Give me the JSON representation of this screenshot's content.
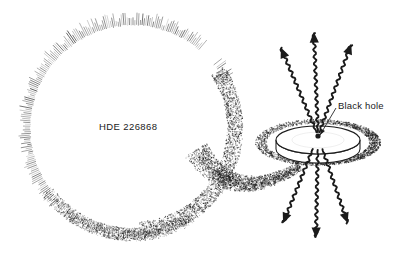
{
  "diagram": {
    "background_color": "#ffffff",
    "ink_color": "#1b1b1b",
    "labels": {
      "star": "HDE 226868",
      "black_hole": "Black hole"
    },
    "objects": {
      "star": {
        "name": "supergiant-star",
        "center_x": 133,
        "center_y": 128,
        "radius": 104,
        "render": "radial-hatch-spikes",
        "spike_count": 360
      },
      "accretion_disk": {
        "name": "accretion-disk",
        "center_x": 318,
        "center_y": 140,
        "rx": 42,
        "ry": 14,
        "thickness": 9,
        "outer_ring_rx": 57,
        "outer_ring_ry": 21,
        "render": "solid-ellipse-with-stippled-outer-ring"
      },
      "black_hole": {
        "name": "black-hole-point",
        "x": 318,
        "y": 136,
        "radius": 2.6
      },
      "accretion_stream": {
        "name": "accretion-stream",
        "render": "stipple",
        "from": "star tidal bulge",
        "to": "accretion disk"
      },
      "jets": {
        "name": "jet-arrows",
        "style": "wavy",
        "count_up": 3,
        "count_down": 3
      },
      "leader_line": {
        "name": "black-hole-leader-line",
        "from_x": 336,
        "from_y": 108,
        "to_x": 320,
        "to_y": 135
      }
    }
  }
}
